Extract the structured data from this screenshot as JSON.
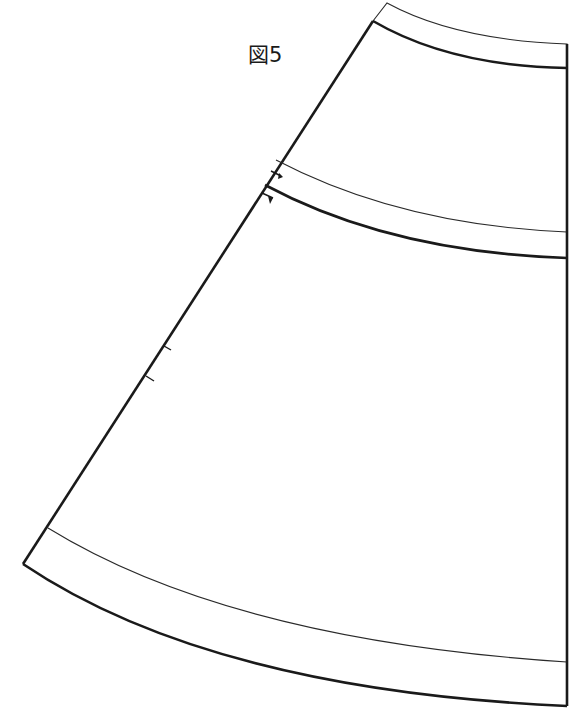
{
  "figure": {
    "label": "図5",
    "colors": {
      "line": "#1a1a1a",
      "background": "#ffffff"
    }
  },
  "pattern": {
    "outline_outer_top": {
      "from": [
        387,
        3
      ],
      "to": [
        567,
        44
      ]
    },
    "waist_line": {
      "from": [
        373,
        21
      ],
      "to": [
        567,
        68
      ]
    },
    "yoke_seam_allowance_line": {
      "from": [
        276,
        160
      ],
      "to": [
        567,
        232
      ]
    },
    "yoke_line": {
      "from": [
        265,
        185
      ],
      "to": [
        567,
        258
      ]
    },
    "hem_fold_line": {
      "from": [
        48,
        528
      ],
      "to": [
        567,
        662
      ]
    },
    "hem_outer": {
      "from": [
        23,
        564
      ],
      "to": [
        567,
        706
      ]
    },
    "center_edge_x": 567,
    "notches": [
      {
        "name": "yoke-notch-upper",
        "at": [
          272,
          172
        ]
      },
      {
        "name": "yoke-notch-lower",
        "at": [
          263,
          196
        ]
      },
      {
        "name": "side-notch-upper",
        "at": [
          165,
          346
        ]
      },
      {
        "name": "side-notch-lower",
        "at": [
          147,
          377
        ]
      }
    ]
  }
}
